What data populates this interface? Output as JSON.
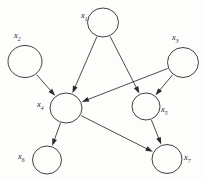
{
  "diagram": {
    "type": "directed-acyclic-graph",
    "title": "",
    "canvas": {
      "width": 205,
      "height": 180,
      "background": "#fdfdfc"
    },
    "style": {
      "node_stroke": "#2b2b2b",
      "node_fill": "none",
      "edge_color": "#2b2b2b",
      "label_color": "#1c1c1c"
    },
    "nodes": [
      {
        "id": "x1",
        "base": "x",
        "sub": "1",
        "label": "x1",
        "cx": 103,
        "cy": 22.5,
        "rx": 15.5,
        "ry": 14.5,
        "label_x": 81,
        "label_y": 18,
        "label_anchor": "start"
      },
      {
        "id": "x2",
        "base": "x",
        "sub": "2",
        "label": "x2",
        "cx": 25,
        "cy": 61.5,
        "rx": 17,
        "ry": 16,
        "label_x": 14,
        "label_y": 38,
        "label_anchor": "start"
      },
      {
        "id": "x3",
        "base": "x",
        "sub": "3",
        "label": "x3",
        "cx": 183,
        "cy": 62.5,
        "rx": 15.5,
        "ry": 15,
        "label_x": 172,
        "label_y": 40,
        "label_anchor": "start"
      },
      {
        "id": "x4",
        "base": "x",
        "sub": "4",
        "label": "x4",
        "cx": 66,
        "cy": 108,
        "rx": 16,
        "ry": 15,
        "label_x": 37,
        "label_y": 107,
        "label_anchor": "start"
      },
      {
        "id": "x5",
        "base": "x",
        "sub": "5",
        "label": "x5",
        "cx": 146,
        "cy": 106.5,
        "rx": 14,
        "ry": 13.5,
        "label_x": 161,
        "label_y": 112,
        "label_anchor": "start"
      },
      {
        "id": "x6",
        "base": "x",
        "sub": "6",
        "label": "x6",
        "cx": 47,
        "cy": 160,
        "rx": 14.5,
        "ry": 14,
        "label_x": 18,
        "label_y": 159,
        "label_anchor": "start"
      },
      {
        "id": "x7",
        "base": "x",
        "sub": "7",
        "label": "x7",
        "cx": 167,
        "cy": 159,
        "rx": 15,
        "ry": 14.5,
        "label_x": 184,
        "label_y": 160,
        "label_anchor": "start"
      }
    ],
    "edges": [
      {
        "from": "x1",
        "to": "x4",
        "label": "x1 -> x4"
      },
      {
        "from": "x1",
        "to": "x5",
        "label": "x1 -> x5"
      },
      {
        "from": "x2",
        "to": "x4",
        "label": "x2 -> x4"
      },
      {
        "from": "x3",
        "to": "x4",
        "label": "x3 -> x4"
      },
      {
        "from": "x3",
        "to": "x5",
        "label": "x3 -> x5"
      },
      {
        "from": "x4",
        "to": "x6",
        "label": "x4 -> x6"
      },
      {
        "from": "x4",
        "to": "x7",
        "label": "x4 -> x7"
      },
      {
        "from": "x5",
        "to": "x7",
        "label": "x5 -> x7"
      }
    ]
  }
}
